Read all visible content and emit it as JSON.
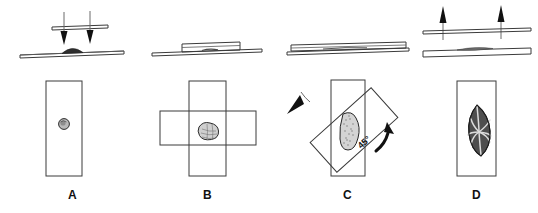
{
  "figure": {
    "panel_count": 4,
    "background_color": "#ffffff",
    "line_color": "#3b3b3b",
    "arrow_color": "#111111"
  },
  "panels": [
    {
      "id": "A",
      "label": "A",
      "side_view": {
        "description": "coverslip pressed down onto slide",
        "slide": "microscope-slide-edge-view",
        "coverslip": "coverslip-edge-view",
        "specimen": "domed-specimen",
        "arrows": 2,
        "arrow_direction": "down"
      },
      "top_view": {
        "slide": "microscope-slide-top-view",
        "specimen": "round-specimen",
        "coverslip": "none"
      }
    },
    {
      "id": "B",
      "label": "B",
      "side_view": {
        "description": "coverslip resting flat on slide over specimen",
        "slide": "microscope-slide-edge-view",
        "coverslip": "coverslip-edge-view",
        "specimen": "flattened-specimen",
        "arrows": 0,
        "arrow_direction": "none"
      },
      "top_view": {
        "slide": "microscope-slide-top-view",
        "specimen": "flattened-irregular-specimen",
        "coverslip": "coverslip-horizontal"
      }
    },
    {
      "id": "C",
      "label": "C",
      "angle_label": "45°",
      "side_view": {
        "description": "coverslip rotated on slide",
        "slide": "microscope-slide-edge-view",
        "coverslip": "coverslip-edge-view",
        "specimen": "smeared-specimen",
        "arrows": 0,
        "arrow_direction": "none"
      },
      "top_view": {
        "slide": "microscope-slide-top-view",
        "specimen": "elongated-stippled-specimen",
        "coverslip": "coverslip-rotated-45",
        "rotation_arrows": [
          "rotation-arrow-left",
          "rotation-arrow-right"
        ]
      }
    },
    {
      "id": "D",
      "label": "D",
      "side_view": {
        "description": "coverslip lifted off slide",
        "slide": "microscope-slide-edge-view",
        "coverslip": "coverslip-edge-view",
        "specimen": "spread-specimen",
        "arrows": 2,
        "arrow_direction": "up"
      },
      "top_view": {
        "slide": "microscope-slide-top-view",
        "specimen": "leaf-shaped-spread-specimen",
        "coverslip": "none"
      }
    }
  ]
}
